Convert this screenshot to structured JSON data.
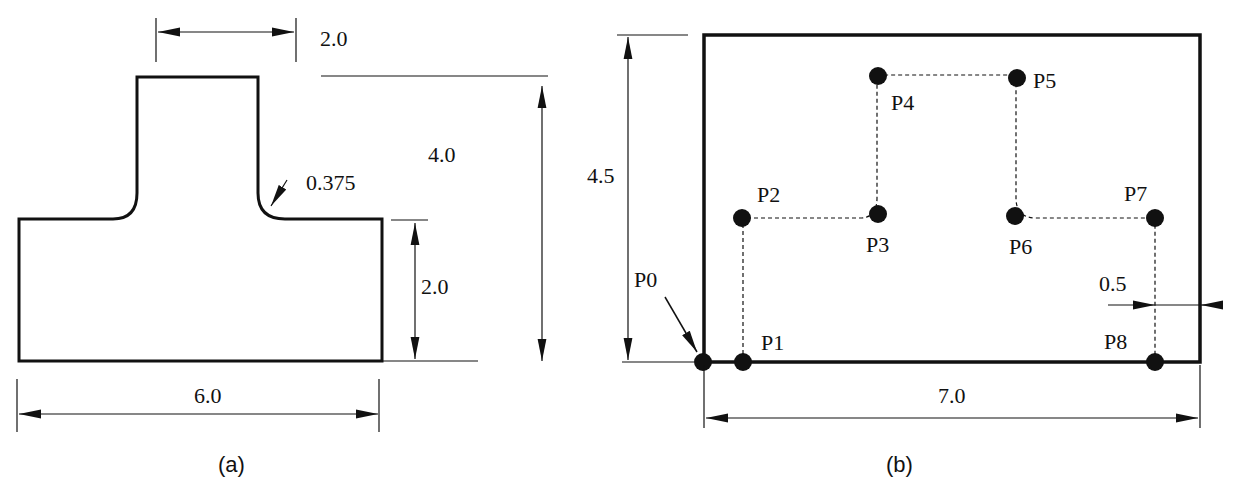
{
  "figure_a": {
    "caption": "(a)",
    "dims": {
      "top_width": "2.0",
      "total_height": "4.0",
      "fillet_radius": "0.375",
      "base_height": "2.0",
      "base_width": "6.0"
    }
  },
  "figure_b": {
    "caption": "(b)",
    "dims": {
      "height": "4.5",
      "width": "7.0",
      "offset": "0.5"
    },
    "points": [
      {
        "label": "P0"
      },
      {
        "label": "P1"
      },
      {
        "label": "P2"
      },
      {
        "label": "P3"
      },
      {
        "label": "P4"
      },
      {
        "label": "P5"
      },
      {
        "label": "P6"
      },
      {
        "label": "P7"
      },
      {
        "label": "P8"
      }
    ]
  }
}
